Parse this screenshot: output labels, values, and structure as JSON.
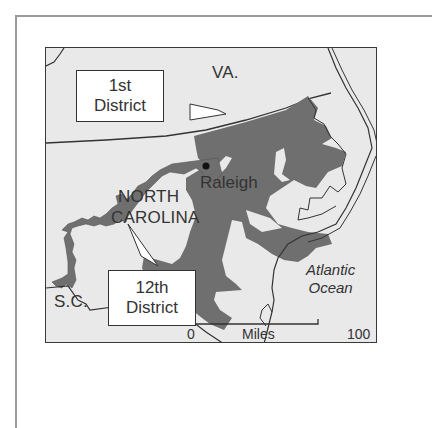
{
  "map": {
    "title": "North Carolina congressional districts",
    "labels": {
      "virginia": "VA.",
      "north_carolina_line1": "NORTH",
      "north_carolina_line2": "CAROLINA",
      "south_carolina": "S.C.",
      "city": "Raleigh",
      "ocean_line1": "Atlantic",
      "ocean_line2": "Ocean"
    },
    "callouts": [
      {
        "line1": "1st",
        "line2": "District"
      },
      {
        "line1": "12th",
        "line2": "District"
      }
    ],
    "scale_bar": {
      "start": "0",
      "unit": "Miles",
      "end": "100"
    },
    "colors": {
      "land": "#e9e9e9",
      "district": "#6f6f6f",
      "border": "#333333",
      "frame": "#9a9a9a"
    }
  }
}
